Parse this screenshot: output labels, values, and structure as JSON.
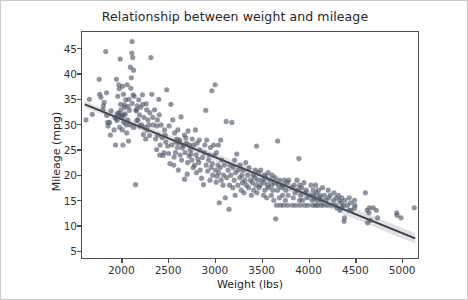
{
  "chart_data": {
    "type": "scatter",
    "title": "Relationship between weight and mileage",
    "xlabel": "Weight (lbs)",
    "ylabel": "Mileage (mpg)",
    "xlim": [
      1570,
      5180
    ],
    "ylim": [
      3.5,
      48.5
    ],
    "xticks": [
      2000,
      2500,
      3000,
      3500,
      4000,
      4500,
      5000
    ],
    "yticks": [
      5,
      10,
      15,
      20,
      25,
      30,
      35,
      40,
      45
    ],
    "grid": false,
    "legend": null,
    "marker": {
      "color": "#4c5566",
      "opacity": 0.62,
      "size": 5.2,
      "shape": "circle"
    },
    "regression": {
      "type": "linear-fit",
      "color": "#3d3d3d",
      "band_color": "#b9bcc4",
      "x_start": 1600,
      "y_start": 34.1,
      "x_end": 5150,
      "y_end": 7.4
    },
    "points": [
      [
        1613,
        31.0
      ],
      [
        1649,
        35.1
      ],
      [
        1680,
        32.1
      ],
      [
        1755,
        39.1
      ],
      [
        1760,
        36.1
      ],
      [
        1773,
        35.5
      ],
      [
        1795,
        33.0
      ],
      [
        1800,
        33.8
      ],
      [
        1808,
        34.5
      ],
      [
        1825,
        44.6
      ],
      [
        1834,
        36.4
      ],
      [
        1835,
        31.9
      ],
      [
        1845,
        30.5
      ],
      [
        1850,
        29.8
      ],
      [
        1867,
        30.5
      ],
      [
        1875,
        28.0
      ],
      [
        1883,
        32.8
      ],
      [
        1915,
        29.0
      ],
      [
        1925,
        31.5
      ],
      [
        1930,
        26.0
      ],
      [
        1937,
        31.3
      ],
      [
        1940,
        39.1
      ],
      [
        1945,
        30.9
      ],
      [
        1950,
        32.3
      ],
      [
        1955,
        35.7
      ],
      [
        1963,
        31.8
      ],
      [
        1965,
        38.0
      ],
      [
        1968,
        32.4
      ],
      [
        1970,
        37.2
      ],
      [
        1975,
        29.5
      ],
      [
        1980,
        43.1
      ],
      [
        1985,
        34.1
      ],
      [
        1990,
        33.0
      ],
      [
        1995,
        31.6
      ],
      [
        2000,
        32.0
      ],
      [
        2003,
        29.0
      ],
      [
        2005,
        37.7
      ],
      [
        2010,
        26.0
      ],
      [
        2015,
        36.1
      ],
      [
        2019,
        30.5
      ],
      [
        2020,
        31.9
      ],
      [
        2025,
        34.0
      ],
      [
        2030,
        33.5
      ],
      [
        2035,
        32.2
      ],
      [
        2040,
        35.0
      ],
      [
        2045,
        30.0
      ],
      [
        2050,
        28.4
      ],
      [
        2055,
        38.0
      ],
      [
        2060,
        31.0
      ],
      [
        2065,
        33.7
      ],
      [
        2070,
        26.8
      ],
      [
        2075,
        35.1
      ],
      [
        2080,
        32.9
      ],
      [
        2085,
        30.0
      ],
      [
        2090,
        41.5
      ],
      [
        2095,
        37.3
      ],
      [
        2100,
        39.4
      ],
      [
        2105,
        44.3
      ],
      [
        2108,
        46.6
      ],
      [
        2110,
        34.3
      ],
      [
        2115,
        43.4
      ],
      [
        2120,
        36.0
      ],
      [
        2124,
        40.9
      ],
      [
        2125,
        29.5
      ],
      [
        2130,
        35.7
      ],
      [
        2145,
        18.1
      ],
      [
        2150,
        32.8
      ],
      [
        2155,
        33.0
      ],
      [
        2160,
        30.9
      ],
      [
        2164,
        33.8
      ],
      [
        2171,
        31.0
      ],
      [
        2180,
        35.0
      ],
      [
        2188,
        32.0
      ],
      [
        2190,
        29.8
      ],
      [
        2200,
        33.5
      ],
      [
        2210,
        30.0
      ],
      [
        2219,
        36.0
      ],
      [
        2223,
        34.1
      ],
      [
        2230,
        28.1
      ],
      [
        2234,
        31.5
      ],
      [
        2245,
        29.5
      ],
      [
        2254,
        27.2
      ],
      [
        2260,
        34.2
      ],
      [
        2265,
        33.0
      ],
      [
        2270,
        29.0
      ],
      [
        2278,
        31.0
      ],
      [
        2288,
        30.0
      ],
      [
        2295,
        27.9
      ],
      [
        2300,
        32.4
      ],
      [
        2310,
        43.4
      ],
      [
        2320,
        36.1
      ],
      [
        2330,
        31.5
      ],
      [
        2335,
        30.0
      ],
      [
        2350,
        33.0
      ],
      [
        2360,
        27.2
      ],
      [
        2372,
        25.1
      ],
      [
        2375,
        29.8
      ],
      [
        2379,
        31.0
      ],
      [
        2385,
        28.0
      ],
      [
        2395,
        35.1
      ],
      [
        2400,
        32.0
      ],
      [
        2405,
        24.0
      ],
      [
        2410,
        26.0
      ],
      [
        2420,
        30.0
      ],
      [
        2430,
        27.5
      ],
      [
        2440,
        23.9
      ],
      [
        2451,
        24.5
      ],
      [
        2457,
        29.0
      ],
      [
        2464,
        28.0
      ],
      [
        2470,
        26.6
      ],
      [
        2480,
        37.0
      ],
      [
        2490,
        25.8
      ],
      [
        2500,
        24.3
      ],
      [
        2506,
        29.8
      ],
      [
        2515,
        22.3
      ],
      [
        2525,
        34.1
      ],
      [
        2535,
        26.0
      ],
      [
        2545,
        31.0
      ],
      [
        2556,
        22.0
      ],
      [
        2560,
        23.6
      ],
      [
        2565,
        28.4
      ],
      [
        2575,
        24.5
      ],
      [
        2580,
        26.6
      ],
      [
        2590,
        27.2
      ],
      [
        2595,
        25.5
      ],
      [
        2600,
        29.0
      ],
      [
        2605,
        21.0
      ],
      [
        2614,
        26.5
      ],
      [
        2620,
        27.0
      ],
      [
        2625,
        24.0
      ],
      [
        2634,
        31.6
      ],
      [
        2640,
        23.0
      ],
      [
        2648,
        25.4
      ],
      [
        2660,
        26.0
      ],
      [
        2670,
        28.0
      ],
      [
        2672,
        19.2
      ],
      [
        2678,
        24.5
      ],
      [
        2685,
        27.4
      ],
      [
        2694,
        26.4
      ],
      [
        2700,
        20.2
      ],
      [
        2705,
        22.5
      ],
      [
        2710,
        28.8
      ],
      [
        2720,
        23.8
      ],
      [
        2725,
        26.0
      ],
      [
        2735,
        25.0
      ],
      [
        2740,
        24.2
      ],
      [
        2750,
        23.0
      ],
      [
        2755,
        27.2
      ],
      [
        2765,
        21.5
      ],
      [
        2770,
        26.0
      ],
      [
        2780,
        22.0
      ],
      [
        2789,
        29.0
      ],
      [
        2795,
        24.0
      ],
      [
        2800,
        20.5
      ],
      [
        2807,
        26.4
      ],
      [
        2815,
        23.2
      ],
      [
        2825,
        22.5
      ],
      [
        2830,
        27.0
      ],
      [
        2835,
        25.0
      ],
      [
        2840,
        21.0
      ],
      [
        2855,
        19.4
      ],
      [
        2865,
        23.5
      ],
      [
        2875,
        18.1
      ],
      [
        2885,
        24.5
      ],
      [
        2890,
        26.0
      ],
      [
        2900,
        32.9
      ],
      [
        2904,
        22.0
      ],
      [
        2910,
        27.0
      ],
      [
        2920,
        20.8
      ],
      [
        2930,
        23.0
      ],
      [
        2935,
        24.0
      ],
      [
        2945,
        19.0
      ],
      [
        2950,
        25.5
      ],
      [
        2957,
        21.5
      ],
      [
        2965,
        36.8
      ],
      [
        2970,
        22.3
      ],
      [
        2975,
        20.0
      ],
      [
        2984,
        26.0
      ],
      [
        2990,
        23.9
      ],
      [
        3000,
        38.0
      ],
      [
        3005,
        21.0
      ],
      [
        3012,
        18.6
      ],
      [
        3015,
        24.5
      ],
      [
        3021,
        19.8
      ],
      [
        3030,
        22.0
      ],
      [
        3035,
        26.0
      ],
      [
        3039,
        20.5
      ],
      [
        3045,
        14.5
      ],
      [
        3055,
        21.5
      ],
      [
        3060,
        27.0
      ],
      [
        3065,
        19.0
      ],
      [
        3070,
        23.0
      ],
      [
        3085,
        18.0
      ],
      [
        3090,
        20.0
      ],
      [
        3100,
        22.0
      ],
      [
        3110,
        15.5
      ],
      [
        3120,
        30.7
      ],
      [
        3125,
        19.5
      ],
      [
        3139,
        21.0
      ],
      [
        3150,
        13.2
      ],
      [
        3155,
        18.0
      ],
      [
        3160,
        22.0
      ],
      [
        3169,
        20.0
      ],
      [
        3180,
        30.5
      ],
      [
        3190,
        17.5
      ],
      [
        3193,
        21.5
      ],
      [
        3205,
        19.0
      ],
      [
        3210,
        23.0
      ],
      [
        3215,
        16.0
      ],
      [
        3220,
        20.5
      ],
      [
        3233,
        24.2
      ],
      [
        3245,
        18.0
      ],
      [
        3250,
        21.0
      ],
      [
        3265,
        19.5
      ],
      [
        3270,
        22.0
      ],
      [
        3280,
        17.0
      ],
      [
        3288,
        20.0
      ],
      [
        3295,
        18.5
      ],
      [
        3302,
        21.0
      ],
      [
        3310,
        16.5
      ],
      [
        3320,
        19.0
      ],
      [
        3329,
        22.5
      ],
      [
        3336,
        18.0
      ],
      [
        3350,
        20.0
      ],
      [
        3360,
        17.5
      ],
      [
        3365,
        21.5
      ],
      [
        3380,
        19.0
      ],
      [
        3390,
        16.0
      ],
      [
        3400,
        18.5
      ],
      [
        3410,
        20.0
      ],
      [
        3415,
        17.0
      ],
      [
        3425,
        19.5
      ],
      [
        3433,
        21.0
      ],
      [
        3439,
        18.0
      ],
      [
        3445,
        25.8
      ],
      [
        3450,
        16.5
      ],
      [
        3459,
        19.0
      ],
      [
        3465,
        20.5
      ],
      [
        3472,
        17.5
      ],
      [
        3485,
        18.0
      ],
      [
        3490,
        21.0
      ],
      [
        3504,
        19.0
      ],
      [
        3520,
        16.0
      ],
      [
        3525,
        18.5
      ],
      [
        3530,
        20.0
      ],
      [
        3535,
        17.0
      ],
      [
        3545,
        19.5
      ],
      [
        3555,
        15.5
      ],
      [
        3563,
        18.0
      ],
      [
        3570,
        20.5
      ],
      [
        3574,
        17.5
      ],
      [
        3590,
        19.0
      ],
      [
        3605,
        16.0
      ],
      [
        3609,
        18.0
      ],
      [
        3613,
        20.0
      ],
      [
        3620,
        17.0
      ],
      [
        3630,
        15.0
      ],
      [
        3640,
        18.5
      ],
      [
        3645,
        19.5
      ],
      [
        3651,
        11.3
      ],
      [
        3660,
        14.0
      ],
      [
        3670,
        17.0
      ],
      [
        3672,
        26.8
      ],
      [
        3680,
        18.0
      ],
      [
        3690,
        15.5
      ],
      [
        3693,
        19.0
      ],
      [
        3700,
        14.0
      ],
      [
        3715,
        17.5
      ],
      [
        3725,
        16.0
      ],
      [
        3730,
        18.0
      ],
      [
        3735,
        14.0
      ],
      [
        3745,
        19.0
      ],
      [
        3755,
        15.0
      ],
      [
        3760,
        17.0
      ],
      [
        3777,
        18.5
      ],
      [
        3780,
        14.0
      ],
      [
        3785,
        16.0
      ],
      [
        3790,
        19.0
      ],
      [
        3820,
        17.5
      ],
      [
        3830,
        14.0
      ],
      [
        3840,
        15.5
      ],
      [
        3850,
        18.0
      ],
      [
        3860,
        16.5
      ],
      [
        3870,
        14.0
      ],
      [
        3880,
        19.0
      ],
      [
        3890,
        17.0
      ],
      [
        3900,
        23.3
      ],
      [
        3907,
        15.0
      ],
      [
        3910,
        18.0
      ],
      [
        3915,
        14.0
      ],
      [
        3920,
        16.0
      ],
      [
        3930,
        17.5
      ],
      [
        3940,
        15.0
      ],
      [
        3955,
        18.5
      ],
      [
        3962,
        14.0
      ],
      [
        3970,
        16.5
      ],
      [
        3980,
        17.0
      ],
      [
        3988,
        15.5
      ],
      [
        4000,
        14.0
      ],
      [
        4020,
        16.0
      ],
      [
        4030,
        18.0
      ],
      [
        4042,
        15.0
      ],
      [
        4050,
        14.0
      ],
      [
        4054,
        17.0
      ],
      [
        4060,
        16.0
      ],
      [
        4065,
        15.5
      ],
      [
        4077,
        14.0
      ],
      [
        4080,
        18.0
      ],
      [
        4090,
        16.5
      ],
      [
        4096,
        15.0
      ],
      [
        4100,
        14.0
      ],
      [
        4110,
        17.0
      ],
      [
        4120,
        15.5
      ],
      [
        4129,
        16.0
      ],
      [
        4135,
        14.0
      ],
      [
        4141,
        15.0
      ],
      [
        4154,
        17.5
      ],
      [
        4165,
        14.0
      ],
      [
        4175,
        16.0
      ],
      [
        4190,
        15.0
      ],
      [
        4209,
        14.0
      ],
      [
        4215,
        17.0
      ],
      [
        4220,
        15.5
      ],
      [
        4237,
        16.0
      ],
      [
        4257,
        14.0
      ],
      [
        4274,
        15.0
      ],
      [
        4278,
        16.5
      ],
      [
        4295,
        14.0
      ],
      [
        4300,
        15.5
      ],
      [
        4312,
        13.5
      ],
      [
        4325,
        16.0
      ],
      [
        4335,
        15.0
      ],
      [
        4341,
        13.0
      ],
      [
        4354,
        14.5
      ],
      [
        4360,
        15.5
      ],
      [
        4363,
        13.5
      ],
      [
        4380,
        14.0
      ],
      [
        4385,
        10.8
      ],
      [
        4390,
        11.5
      ],
      [
        4395,
        15.0
      ],
      [
        4422,
        14.0
      ],
      [
        4440,
        13.0
      ],
      [
        4441,
        15.5
      ],
      [
        4456,
        14.5
      ],
      [
        4464,
        13.0
      ],
      [
        4498,
        15.0
      ],
      [
        4499,
        13.5
      ],
      [
        4502,
        14.0
      ],
      [
        4615,
        16.5
      ],
      [
        4633,
        13.0
      ],
      [
        4638,
        10.5
      ],
      [
        4654,
        12.5
      ],
      [
        4657,
        13.5
      ],
      [
        4668,
        11.0
      ],
      [
        4699,
        13.5
      ],
      [
        4732,
        13.0
      ],
      [
        4746,
        11.5
      ],
      [
        4951,
        12.5
      ],
      [
        4955,
        12.0
      ],
      [
        4997,
        11.5
      ],
      [
        5140,
        13.5
      ]
    ]
  }
}
